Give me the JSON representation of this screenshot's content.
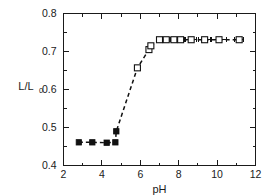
{
  "chart_data": {
    "type": "scatter",
    "title": "",
    "xlabel": "pH",
    "ylabel": "L/L0",
    "ylabel_main": "L/L",
    "ylabel_subscript": "0",
    "xlim": [
      2,
      12
    ],
    "ylim": [
      0.4,
      0.8
    ],
    "xticks": [
      2,
      4,
      6,
      8,
      10,
      12
    ],
    "xticklabels": [
      "2",
      "4",
      "6",
      "8",
      "10",
      "12"
    ],
    "yticks": [
      0.4,
      0.5,
      0.6,
      0.7,
      0.8
    ],
    "yticklabels": [
      "0.4",
      "0.5",
      "0.6",
      "0.7",
      "0.8"
    ],
    "x_minor_ticks": [
      3,
      5,
      7,
      9,
      11
    ],
    "y_minor_ticks": [
      0.45,
      0.55,
      0.65,
      0.75
    ],
    "grid": false,
    "legend": false,
    "series": [
      {
        "name": "collapsed-state",
        "marker": "filled-square",
        "connector": "dashed",
        "points": [
          {
            "x": 2.8,
            "y": 0.461
          },
          {
            "x": 3.5,
            "y": 0.461
          },
          {
            "x": 4.25,
            "y": 0.46
          },
          {
            "x": 4.7,
            "y": 0.461
          },
          {
            "x": 4.75,
            "y": 0.49
          }
        ]
      },
      {
        "name": "swollen-state",
        "marker": "open-square",
        "connector": "dashed",
        "points": [
          {
            "x": 5.85,
            "y": 0.657,
            "xerr": 0.0
          },
          {
            "x": 6.45,
            "y": 0.705,
            "xerr": 0.0
          },
          {
            "x": 6.55,
            "y": 0.715,
            "xerr": 0.0
          },
          {
            "x": 7.0,
            "y": 0.731,
            "xerr": 0.18
          },
          {
            "x": 7.35,
            "y": 0.731,
            "xerr": 0.18
          },
          {
            "x": 7.75,
            "y": 0.731,
            "xerr": 0.18
          },
          {
            "x": 8.1,
            "y": 0.731,
            "xerr": 0.18
          },
          {
            "x": 8.65,
            "y": 0.731,
            "xerr": 0.3
          },
          {
            "x": 9.35,
            "y": 0.731,
            "xerr": 0.3
          },
          {
            "x": 10.1,
            "y": 0.731,
            "xerr": 0.4
          },
          {
            "x": 11.15,
            "y": 0.731,
            "xerr": 0.25
          }
        ]
      }
    ],
    "colors": {
      "axis": "#1a1a1a",
      "marker_fill": "#111111",
      "marker_open_fill": "#ffffff",
      "line": "#111111",
      "background": "#ffffff"
    }
  }
}
